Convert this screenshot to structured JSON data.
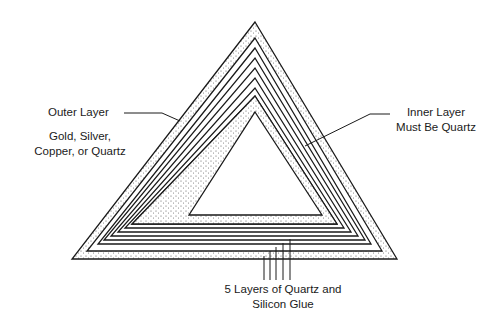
{
  "diagram": {
    "type": "concentric-triangle-layers",
    "colors": {
      "line": "#1a1a1a",
      "stipple": "#555555",
      "background": "#ffffff"
    },
    "labels": {
      "outer_title": "Outer Layer",
      "outer_material_line1": "Gold, Silver,",
      "outer_material_line2": "Copper, or Quartz",
      "inner_line1": "Inner Layer",
      "inner_line2": "Must Be Quartz",
      "middle_line1": "5 Layers of Quartz and",
      "middle_line2": "Silicon Glue"
    },
    "layers": [
      {
        "name": "outer layer",
        "material": "Gold, Silver, Copper, or Quartz",
        "fill": "stippled"
      },
      {
        "name": "middle layers",
        "count": 5,
        "material": "Quartz and Silicon Glue",
        "fill": "lines"
      },
      {
        "name": "inner layer",
        "material": "Quartz",
        "fill": "stippled"
      }
    ]
  }
}
